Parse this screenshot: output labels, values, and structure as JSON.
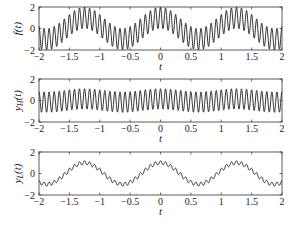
{
  "chart_data": [
    {
      "type": "line",
      "title": "",
      "xlabel": "t",
      "ylabel": "f(t)",
      "xlim": [
        -2,
        2
      ],
      "ylim": [
        -2,
        2
      ],
      "xticks": [
        "-2",
        "-1.5",
        "-1",
        "-0.5",
        "0",
        "0.5",
        "1",
        "1.5",
        "2"
      ],
      "yticks": [
        "-2",
        "0",
        "2"
      ],
      "grid": false,
      "series": [
        {
          "name": "f(t)",
          "components": [
            {
              "amp": 1.0,
              "freq_hz": 0.8
            },
            {
              "amp": 1.0,
              "freq_hz": 12
            }
          ],
          "color": "#1a1a1a"
        }
      ]
    },
    {
      "type": "line",
      "title": "",
      "xlabel": "t",
      "ylabel": "y_H(t)",
      "xlim": [
        -2,
        2
      ],
      "ylim": [
        -2,
        2
      ],
      "xticks": [
        "-2",
        "-1.5",
        "-1",
        "-0.5",
        "0",
        "0.5",
        "1",
        "1.5",
        "2"
      ],
      "yticks": [
        "-2",
        "0",
        "2"
      ],
      "grid": false,
      "series": [
        {
          "name": "y_H(t)",
          "components": [
            {
              "amp": 0.15,
              "freq_hz": 0.8
            },
            {
              "amp": 0.95,
              "freq_hz": 12
            }
          ],
          "color": "#1a1a1a"
        }
      ]
    },
    {
      "type": "line",
      "title": "",
      "xlabel": "t",
      "ylabel": "y_L(t)",
      "xlim": [
        -2,
        2
      ],
      "ylim": [
        -2,
        2
      ],
      "xticks": [
        "-2",
        "-1.5",
        "-1",
        "-0.5",
        "0",
        "0.5",
        "1",
        "1.5",
        "2"
      ],
      "yticks": [
        "-2",
        "0",
        "2"
      ],
      "grid": false,
      "series": [
        {
          "name": "y_L(t)",
          "components": [
            {
              "amp": 1.0,
              "freq_hz": 0.8
            },
            {
              "amp": 0.18,
              "freq_hz": 12
            }
          ],
          "color": "#1a1a1a"
        }
      ]
    }
  ],
  "panels": [
    {
      "ylabel_main": "f",
      "ylabel_sub": "",
      "ylabel_tail": "(t)",
      "xlabel": "t"
    },
    {
      "ylabel_main": "y",
      "ylabel_sub": "H",
      "ylabel_tail": "(t)",
      "xlabel": "t"
    },
    {
      "ylabel_main": "y",
      "ylabel_sub": "L",
      "ylabel_tail": "(t)",
      "xlabel": "t"
    }
  ]
}
